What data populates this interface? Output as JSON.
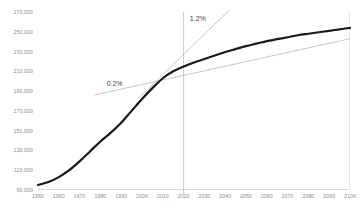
{
  "chart_data": {
    "type": "line",
    "title": "",
    "subtitle": "",
    "xlabel": "",
    "ylabel": "",
    "xlim": [
      1950,
      2100
    ],
    "ylim": [
      90000,
      270000
    ],
    "grid": false,
    "legend": null,
    "y_ticks": [
      "270,000",
      "250,000",
      "230,000",
      "210,000",
      "190,000",
      "170,000",
      "150,000",
      "130,000",
      "110,000",
      "90,000"
    ],
    "y_tick_values": [
      270000,
      250000,
      230000,
      210000,
      190000,
      170000,
      150000,
      130000,
      110000,
      90000
    ],
    "x_ticks": [
      "1950",
      "1960",
      "1970",
      "1980",
      "1990",
      "2000",
      "2010",
      "2020",
      "2030",
      "2040",
      "2050",
      "2060",
      "2070",
      "2080",
      "2090",
      "2100"
    ],
    "x_tick_values": [
      1950,
      1960,
      1970,
      1980,
      1990,
      2000,
      2010,
      2020,
      2030,
      2040,
      2050,
      2060,
      2070,
      2080,
      2090,
      2100
    ],
    "series": [
      {
        "name": "population",
        "color": "#1a1a1a",
        "width": 2.2,
        "x": [
          1950,
          1955,
          1960,
          1965,
          1970,
          1975,
          1980,
          1985,
          1990,
          1995,
          2000,
          2005,
          2010,
          2015,
          2020,
          2025,
          2030,
          2035,
          2040,
          2045,
          2050,
          2055,
          2060,
          2065,
          2070,
          2075,
          2080,
          2085,
          2090,
          2095,
          2100
        ],
        "values": [
          95000,
          98000,
          103000,
          110000,
          119000,
          129000,
          139000,
          148000,
          158000,
          170000,
          182000,
          193000,
          203000,
          210000,
          215000,
          219000,
          222500,
          226000,
          229500,
          232500,
          235500,
          238000,
          240500,
          242500,
          244500,
          246500,
          248000,
          249500,
          251000,
          252500,
          254000
        ]
      }
    ],
    "trendlines": [
      {
        "name": "low-growth-trend",
        "label": "0.2%",
        "rate": "0.2%",
        "color": "#b0b0b0",
        "x_start": 1977,
        "y_start": 186000,
        "x_end": 2100,
        "y_end": 243000
      },
      {
        "name": "high-growth-trend",
        "label": "1.2%",
        "rate": "1.2%",
        "color": "#b0b0b0",
        "x_start": 1998,
        "y_start": 182000,
        "x_end": 2042,
        "y_end": 272000
      }
    ],
    "reference_line": {
      "name": "present-day-divider",
      "orientation": "vertical",
      "x": 2020,
      "color": "#cccccc"
    },
    "annotations": [
      {
        "text": "0.2%",
        "x": 1983,
        "y": 196000
      },
      {
        "text": "1.2%",
        "x": 2023,
        "y": 262000
      }
    ]
  }
}
